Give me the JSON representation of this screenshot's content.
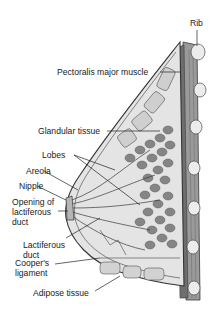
{
  "figure": {
    "labels": {
      "rib": "Rib",
      "pectoralis": "Pectoralis major muscle",
      "glandular": "Glandular tissue",
      "lobes": "Lobes",
      "areola": "Areola",
      "nipple": "Nipple",
      "opening": "Opening of\nlactiferous\nduct",
      "lactiferous_duct": "Lactiferous\nduct",
      "coopers": "Cooper's\nligament",
      "adipose": "Adipose tissue"
    },
    "colors": {
      "background": "#ffffff",
      "outline": "#3a3a3a",
      "muscle": "#8a8a8a",
      "lobule": "#7d7d7d",
      "fat": "#d6d6d6",
      "rib": "#e8e8e8",
      "label_text": "#1a1a1a"
    }
  }
}
